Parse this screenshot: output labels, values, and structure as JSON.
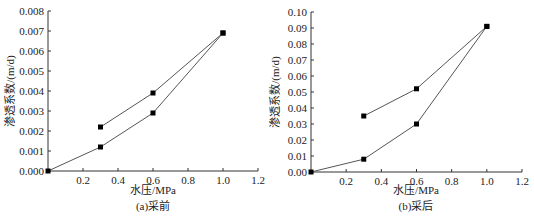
{
  "chart_data": [
    {
      "type": "line",
      "panel": "a",
      "caption": "(a)采前",
      "xlabel": "水压/MPa",
      "ylabel": "渗透系数/(m/d)",
      "xlim": [
        0,
        1.2
      ],
      "ylim": [
        0,
        0.008
      ],
      "xticks": [
        0.2,
        0.4,
        0.6,
        0.8,
        1.0,
        1.2
      ],
      "xtick_labels": [
        "0.2",
        "0.4",
        "0.6",
        "0.8",
        "1.0",
        "1.2"
      ],
      "yticks": [
        0,
        0.001,
        0.002,
        0.003,
        0.004,
        0.005,
        0.006,
        0.007,
        0.008
      ],
      "ytick_labels": [
        "0.000",
        "0.001",
        "0.002",
        "0.003",
        "0.004",
        "0.005",
        "0.006",
        "0.007",
        "0.008"
      ],
      "grid": false,
      "marker": "square",
      "series": [
        {
          "name": "loading",
          "x": [
            0,
            0.3,
            0.6,
            1.0
          ],
          "y": [
            0.0,
            0.0012,
            0.0029,
            0.0069
          ]
        },
        {
          "name": "unloading",
          "x": [
            1.0,
            0.6,
            0.3
          ],
          "y": [
            0.0069,
            0.0039,
            0.0022
          ]
        }
      ]
    },
    {
      "type": "line",
      "panel": "b",
      "caption": "(b)采后",
      "xlabel": "水压/MPa",
      "ylabel": "渗透系数/(m/d)",
      "xlim": [
        0,
        1.2
      ],
      "ylim": [
        0,
        0.1
      ],
      "xticks": [
        0.2,
        0.4,
        0.6,
        0.8,
        1.0,
        1.2
      ],
      "xtick_labels": [
        "0.2",
        "0.4",
        "0.6",
        "0.8",
        "1.0",
        "1.2"
      ],
      "yticks": [
        0,
        0.01,
        0.02,
        0.03,
        0.04,
        0.05,
        0.06,
        0.07,
        0.08,
        0.09,
        0.1
      ],
      "ytick_labels": [
        "0.00",
        "0.01",
        "0.02",
        "0.03",
        "0.04",
        "0.05",
        "0.06",
        "0.07",
        "0.08",
        "0.09",
        "0.10"
      ],
      "grid": false,
      "marker": "square",
      "series": [
        {
          "name": "loading",
          "x": [
            0,
            0.3,
            0.6,
            1.0
          ],
          "y": [
            0.0,
            0.008,
            0.03,
            0.091
          ]
        },
        {
          "name": "unloading",
          "x": [
            1.0,
            0.6,
            0.3
          ],
          "y": [
            0.091,
            0.052,
            0.035
          ]
        }
      ]
    }
  ],
  "layout": [
    {
      "x0": 48,
      "y0": 171,
      "x1": 258,
      "y1": 11,
      "ylabel_x": 14,
      "ylabel_y": 91,
      "xlabel_x": 153,
      "xlabel_y": 194,
      "caption_x": 153,
      "caption_y": 210
    },
    {
      "x0": 311,
      "y0": 172,
      "x1": 522,
      "y1": 12,
      "ylabel_x": 279,
      "ylabel_y": 92,
      "xlabel_x": 416,
      "xlabel_y": 194,
      "caption_x": 416,
      "caption_y": 210
    }
  ],
  "colors": {
    "axis": "#333333",
    "line": "#555555",
    "marker": "#000000"
  }
}
